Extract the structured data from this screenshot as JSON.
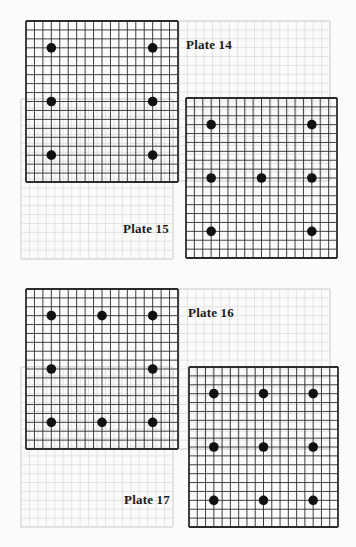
{
  "page": {
    "background": "#fbfbfa",
    "grid_color": "#2b2b2b",
    "stone_color": "#111111"
  },
  "board_size": 19,
  "plates": [
    {
      "label": "Plate 14",
      "stone_count": 6,
      "stones": [
        [
          3,
          3
        ],
        [
          15,
          3
        ],
        [
          3,
          9
        ],
        [
          15,
          9
        ],
        [
          3,
          15
        ],
        [
          15,
          15
        ]
      ]
    },
    {
      "label": "Plate 15",
      "stone_count": 7,
      "stones": [
        [
          3,
          3
        ],
        [
          15,
          3
        ],
        [
          3,
          9
        ],
        [
          9,
          9
        ],
        [
          15,
          9
        ],
        [
          3,
          15
        ],
        [
          15,
          15
        ]
      ]
    },
    {
      "label": "Plate 16",
      "stone_count": 8,
      "stones": [
        [
          3,
          3
        ],
        [
          9,
          3
        ],
        [
          15,
          3
        ],
        [
          3,
          9
        ],
        [
          15,
          9
        ],
        [
          3,
          15
        ],
        [
          9,
          15
        ],
        [
          15,
          15
        ]
      ]
    },
    {
      "label": "Plate 17",
      "stone_count": 9,
      "stones": [
        [
          3,
          3
        ],
        [
          9,
          3
        ],
        [
          15,
          3
        ],
        [
          3,
          9
        ],
        [
          9,
          9
        ],
        [
          15,
          9
        ],
        [
          3,
          15
        ],
        [
          9,
          15
        ],
        [
          15,
          15
        ]
      ]
    }
  ]
}
